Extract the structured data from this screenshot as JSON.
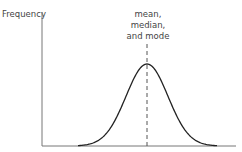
{
  "chart_data": {
    "type": "line",
    "title": "",
    "xlabel": "",
    "ylabel": "Frequency",
    "curve": "normal-distribution",
    "mean": 0,
    "sd": 1,
    "xlim": [
      -3.4,
      4.1
    ],
    "annotation": {
      "lines": [
        "mean,",
        "median,",
        "and mode"
      ],
      "x": 0,
      "line_style": "dashed"
    },
    "grid": false,
    "legend": "none"
  }
}
